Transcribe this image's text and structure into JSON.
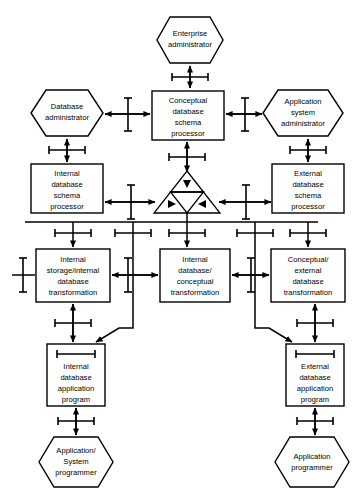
{
  "diagram": {
    "type": "block-diagram",
    "width": 361,
    "height": 497,
    "colors": {
      "stroke": "#000000",
      "fill": "#ffffff",
      "background": "#ffffff"
    },
    "shape_legend": {
      "hexagon": "human role / person",
      "rectangle": "processor or program module",
      "triangle_group": "database / stored data",
      "i_beam_on_arrow": "interface"
    },
    "nodes": [
      {
        "id": "enterprise-administrator",
        "shape": "hexagon",
        "lines": [
          "Enterprise",
          "administrator"
        ],
        "x": 157,
        "y": 17,
        "w": 66,
        "h": 46
      },
      {
        "id": "database-administrator",
        "shape": "hexagon",
        "lines": [
          "Database",
          "administrator"
        ],
        "x": 31,
        "y": 90,
        "w": 72,
        "h": 46
      },
      {
        "id": "application-system-administrator",
        "shape": "hexagon",
        "lines": [
          "Application",
          "system",
          "administrator"
        ],
        "x": 263,
        "y": 90,
        "w": 80,
        "h": 46
      },
      {
        "id": "conceptual-database-schema-processor",
        "shape": "rect",
        "lines": [
          "Conceptual",
          "database",
          "schema",
          "processor"
        ],
        "x": 152,
        "y": 91,
        "w": 72,
        "h": 49
      },
      {
        "id": "internal-database-schema-processor",
        "shape": "rect",
        "lines": [
          "Internal",
          "database",
          "schema",
          "processor"
        ],
        "x": 31,
        "y": 164,
        "w": 72,
        "h": 49
      },
      {
        "id": "external-database-schema-processor",
        "shape": "rect",
        "lines": [
          "External",
          "database",
          "schema",
          "processor"
        ],
        "x": 272,
        "y": 164,
        "w": 72,
        "h": 49
      },
      {
        "id": "database-store",
        "shape": "triangle-group",
        "lines": [],
        "x": 154,
        "y": 171,
        "w": 66,
        "h": 42
      },
      {
        "id": "internal-storage-internal-database-transformation",
        "shape": "rect",
        "lines": [
          "Internal",
          "storage/internal",
          "database",
          "transformation"
        ],
        "x": 36,
        "y": 249,
        "w": 74,
        "h": 53
      },
      {
        "id": "internal-database-conceptual-transformation",
        "shape": "rect",
        "lines": [
          "Internal",
          "database/",
          "conceptual",
          "transformation"
        ],
        "x": 160,
        "y": 249,
        "w": 70,
        "h": 53
      },
      {
        "id": "conceptual-external-database-transformation",
        "shape": "rect",
        "lines": [
          "Conceptual/",
          "external",
          "database",
          "transformation"
        ],
        "x": 271,
        "y": 249,
        "w": 74,
        "h": 53
      },
      {
        "id": "internal-database-application-program",
        "shape": "rect-with-bar",
        "lines": [
          "Internal",
          "database",
          "application",
          "program"
        ],
        "x": 47,
        "y": 344,
        "w": 58,
        "h": 62
      },
      {
        "id": "external-database-application-program",
        "shape": "rect-with-bar",
        "lines": [
          "External",
          "database",
          "application",
          "program"
        ],
        "x": 286,
        "y": 344,
        "w": 58,
        "h": 62
      },
      {
        "id": "application-system-programmer",
        "shape": "hexagon",
        "lines": [
          "Application/",
          "System",
          "programmer"
        ],
        "x": 39,
        "y": 437,
        "w": 74,
        "h": 50
      },
      {
        "id": "application-programmer",
        "shape": "hexagon",
        "lines": [
          "Application",
          "programmer"
        ],
        "x": 275,
        "y": 437,
        "w": 74,
        "h": 50
      }
    ],
    "interfaces": [
      {
        "id": "enterprise-admin-to-conceptual-processor",
        "orientation": "vertical",
        "double_arrow": true
      },
      {
        "id": "database-admin-to-conceptual-processor",
        "orientation": "horizontal",
        "double_arrow": true
      },
      {
        "id": "app-system-admin-to-conceptual-processor",
        "orientation": "horizontal",
        "double_arrow": true
      },
      {
        "id": "database-admin-to-internal-processor",
        "orientation": "vertical",
        "double_arrow": true
      },
      {
        "id": "app-system-admin-to-external-processor",
        "orientation": "vertical",
        "double_arrow": true
      },
      {
        "id": "conceptual-processor-to-database-store",
        "orientation": "vertical",
        "double_arrow": true
      },
      {
        "id": "internal-processor-to-database-store",
        "orientation": "horizontal",
        "double_arrow": true
      },
      {
        "id": "external-processor-to-database-store",
        "orientation": "horizontal",
        "double_arrow": true
      },
      {
        "id": "bus-to-internal-storage-transformation",
        "orientation": "vertical",
        "double_arrow": false
      },
      {
        "id": "bus-to-internal-conceptual-transformation",
        "orientation": "vertical",
        "double_arrow": false
      },
      {
        "id": "bus-to-conceptual-external-transformation",
        "orientation": "vertical",
        "double_arrow": false
      },
      {
        "id": "internal-storage-to-internal-conceptual",
        "orientation": "horizontal",
        "double_arrow": true
      },
      {
        "id": "internal-conceptual-to-conceptual-external",
        "orientation": "horizontal",
        "double_arrow": true
      },
      {
        "id": "internal-storage-left-stub",
        "orientation": "horizontal",
        "double_arrow": false
      },
      {
        "id": "internal-storage-to-app-program",
        "orientation": "vertical",
        "double_arrow": true
      },
      {
        "id": "conceptual-external-to-app-program",
        "orientation": "vertical",
        "double_arrow": true
      },
      {
        "id": "internal-app-program-to-system-programmer",
        "orientation": "vertical",
        "double_arrow": true
      },
      {
        "id": "external-app-program-to-app-programmer",
        "orientation": "vertical",
        "double_arrow": true
      }
    ]
  }
}
